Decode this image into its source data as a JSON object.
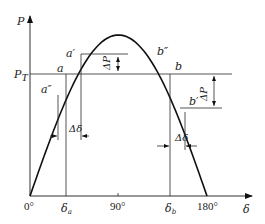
{
  "diagram": {
    "type": "power-angle curve",
    "y_axis_label": "P",
    "x_axis_label": "δ",
    "power_level_label": "P",
    "power_level_subscript": "T",
    "x_ticks": [
      {
        "label": "0°",
        "angle_deg": 0
      },
      {
        "label": "δ",
        "sub": "a",
        "angle_deg": 35
      },
      {
        "label": "90°",
        "angle_deg": 90
      },
      {
        "label": "δ",
        "sub": "b",
        "angle_deg": 145
      },
      {
        "label": "180°",
        "angle_deg": 180
      }
    ],
    "points": {
      "a": "a",
      "a_prime": "a′",
      "a_dprime": "a″",
      "b": "b",
      "b_prime": "b′",
      "b_dprime": "b″"
    },
    "delta_p_label": "ΔP",
    "delta_delta_label": "Δδ",
    "stroke_color": "#111111"
  }
}
